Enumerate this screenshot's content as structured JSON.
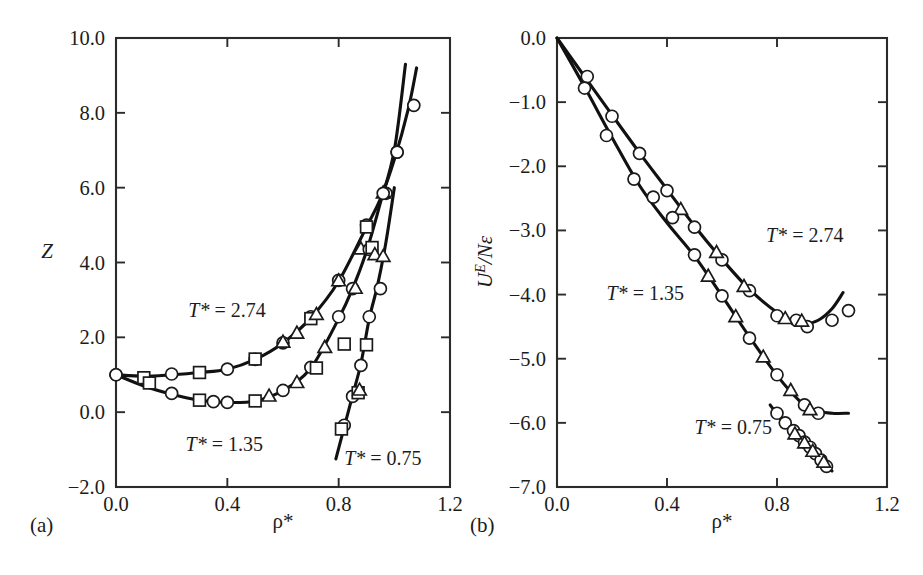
{
  "figure": {
    "background_color": "#ffffff",
    "ink_color": "#1a1a1a",
    "panels": [
      {
        "id": "a",
        "panel_label": "(a)",
        "xlabel": "ρ*",
        "ylabel": "Z"
      },
      {
        "id": "b",
        "panel_label": "(b)",
        "xlabel": "ρ*",
        "ylabel_rich": "Uᴱ/Nε",
        "ylabel_main": "U",
        "ylabel_sup": "E",
        "ylabel_rest": "/Nε"
      }
    ]
  },
  "chart_data": [
    {
      "type": "scatter",
      "panel": "a",
      "title": "",
      "xlabel": "ρ*",
      "ylabel": "Z",
      "xlim": [
        0.0,
        1.2
      ],
      "ylim": [
        -2.0,
        10.0
      ],
      "xticks": [
        0.0,
        0.4,
        0.8,
        1.2
      ],
      "xticklabels": [
        "0.0",
        "0.4",
        "0.8",
        "1.2"
      ],
      "yticks": [
        -2.0,
        0.0,
        2.0,
        4.0,
        6.0,
        8.0,
        10.0
      ],
      "yticklabels": [
        "-2.0",
        "0.0",
        "2.0",
        "4.0",
        "6.0",
        "8.0",
        "10.0"
      ],
      "grid": false,
      "legend": "inline-annotations",
      "annotations": [
        {
          "text_italic": "T*",
          "text_rest": " = 2.74",
          "x": 0.26,
          "y": 2.55
        },
        {
          "text_italic": "T*",
          "text_rest": " = 1.35",
          "x": 0.25,
          "y": -1.05
        },
        {
          "text_italic": "T*",
          "text_rest": " = 0.75",
          "x": 0.82,
          "y": -1.42
        }
      ],
      "series": [
        {
          "name": "T* = 2.74",
          "temperature": 2.74,
          "marker_sets": [
            {
              "marker": "circle",
              "points": [
                [
                  0.0,
                  1.0
                ],
                [
                  0.2,
                  1.02
                ],
                [
                  0.4,
                  1.15
                ],
                [
                  0.5,
                  1.41
                ],
                [
                  0.6,
                  1.85
                ],
                [
                  0.7,
                  2.55
                ],
                [
                  0.8,
                  3.52
                ],
                [
                  0.9,
                  5.0
                ],
                [
                  0.97,
                  5.85
                ],
                [
                  1.01,
                  6.95
                ],
                [
                  1.07,
                  8.2
                ]
              ]
            },
            {
              "marker": "square",
              "points": [
                [
                  0.1,
                  0.92
                ],
                [
                  0.3,
                  1.06
                ],
                [
                  0.5,
                  1.42
                ],
                [
                  0.7,
                  2.5
                ],
                [
                  0.9,
                  4.95
                ]
              ]
            },
            {
              "marker": "triangle",
              "points": [
                [
                  0.6,
                  1.86
                ],
                [
                  0.65,
                  2.1
                ],
                [
                  0.72,
                  2.6
                ],
                [
                  0.8,
                  3.5
                ],
                [
                  0.88,
                  4.35
                ],
                [
                  0.96,
                  5.85
                ]
              ]
            }
          ],
          "fit_curve": [
            [
              0.0,
              1.0
            ],
            [
              0.1,
              0.96
            ],
            [
              0.2,
              1.0
            ],
            [
              0.3,
              1.06
            ],
            [
              0.4,
              1.15
            ],
            [
              0.5,
              1.41
            ],
            [
              0.6,
              1.85
            ],
            [
              0.7,
              2.52
            ],
            [
              0.8,
              3.5
            ],
            [
              0.9,
              4.95
            ],
            [
              0.95,
              5.7
            ],
            [
              1.0,
              6.75
            ],
            [
              1.05,
              8.1
            ],
            [
              1.08,
              9.2
            ]
          ]
        },
        {
          "name": "T* = 1.35",
          "temperature": 1.35,
          "marker_sets": [
            {
              "marker": "circle",
              "points": [
                [
                  0.0,
                  1.0
                ],
                [
                  0.2,
                  0.5
                ],
                [
                  0.35,
                  0.28
                ],
                [
                  0.4,
                  0.26
                ],
                [
                  0.6,
                  0.58
                ],
                [
                  0.7,
                  1.2
                ],
                [
                  0.8,
                  2.55
                ],
                [
                  0.85,
                  3.3
                ],
                [
                  0.91,
                  4.35
                ],
                [
                  0.96,
                  5.85
                ],
                [
                  1.01,
                  6.95
                ]
              ]
            },
            {
              "marker": "square",
              "points": [
                [
                  0.12,
                  0.78
                ],
                [
                  0.3,
                  0.32
                ],
                [
                  0.5,
                  0.3
                ],
                [
                  0.72,
                  1.18
                ],
                [
                  0.82,
                  1.82
                ],
                [
                  0.92,
                  4.4
                ]
              ]
            },
            {
              "marker": "triangle",
              "points": [
                [
                  0.55,
                  0.42
                ],
                [
                  0.65,
                  0.78
                ],
                [
                  0.75,
                  1.72
                ],
                [
                  0.86,
                  3.3
                ],
                [
                  0.93,
                  4.2
                ]
              ]
            }
          ],
          "fit_curve": [
            [
              0.0,
              1.0
            ],
            [
              0.1,
              0.7
            ],
            [
              0.2,
              0.48
            ],
            [
              0.3,
              0.32
            ],
            [
              0.4,
              0.26
            ],
            [
              0.5,
              0.3
            ],
            [
              0.6,
              0.58
            ],
            [
              0.7,
              1.18
            ],
            [
              0.8,
              2.5
            ],
            [
              0.85,
              3.3
            ],
            [
              0.9,
              4.3
            ],
            [
              0.95,
              5.6
            ],
            [
              1.0,
              7.0
            ],
            [
              1.04,
              9.3
            ]
          ]
        },
        {
          "name": "T* = 0.75",
          "temperature": 0.75,
          "marker_sets": [
            {
              "marker": "circle",
              "points": [
                [
                  0.82,
                  -0.35
                ],
                [
                  0.85,
                  0.42
                ],
                [
                  0.88,
                  1.25
                ],
                [
                  0.91,
                  2.55
                ],
                [
                  0.95,
                  3.3
                ]
              ]
            },
            {
              "marker": "square",
              "points": [
                [
                  0.81,
                  -0.45
                ],
                [
                  0.87,
                  0.52
                ],
                [
                  0.9,
                  1.8
                ]
              ]
            },
            {
              "marker": "triangle",
              "points": [
                [
                  0.875,
                  0.58
                ],
                [
                  0.96,
                  4.15
                ]
              ]
            }
          ],
          "fit_curve": [
            [
              0.79,
              -1.25
            ],
            [
              0.82,
              -0.4
            ],
            [
              0.85,
              0.45
            ],
            [
              0.88,
              1.3
            ],
            [
              0.91,
              2.5
            ],
            [
              0.94,
              3.4
            ],
            [
              0.97,
              4.55
            ],
            [
              1.0,
              6.0
            ]
          ]
        }
      ]
    },
    {
      "type": "scatter",
      "panel": "b",
      "title": "",
      "xlabel": "ρ*",
      "ylabel": "U^E/Nε",
      "xlim": [
        0.0,
        1.2
      ],
      "ylim": [
        -7.0,
        0.0
      ],
      "xticks": [
        0.0,
        0.4,
        0.8,
        1.2
      ],
      "xticklabels": [
        "0.0",
        "0.4",
        "0.8",
        "1.2"
      ],
      "yticks": [
        -7.0,
        -6.0,
        -5.0,
        -4.0,
        -3.0,
        -2.0,
        -1.0,
        0.0
      ],
      "yticklabels": [
        "-7.0",
        "-6.0",
        "-5.0",
        "-4.0",
        "-3.0",
        "-2.0",
        "-1.0",
        "0.0"
      ],
      "grid": false,
      "legend": "inline-annotations",
      "annotations": [
        {
          "text_italic": "T*",
          "text_rest": " = 2.74",
          "x": 0.76,
          "y": -3.18
        },
        {
          "text_italic": "T*",
          "text_rest": " = 1.35",
          "x": 0.18,
          "y": -4.08
        },
        {
          "text_italic": "T*",
          "text_rest": " = 0.75",
          "x": 0.5,
          "y": -6.18
        }
      ],
      "series": [
        {
          "name": "T* = 2.74",
          "temperature": 2.74,
          "marker_sets": [
            {
              "marker": "circle",
              "points": [
                [
                  0.11,
                  -0.6
                ],
                [
                  0.2,
                  -1.22
                ],
                [
                  0.3,
                  -1.8
                ],
                [
                  0.4,
                  -2.38
                ],
                [
                  0.5,
                  -2.95
                ],
                [
                  0.6,
                  -3.46
                ],
                [
                  0.7,
                  -3.94
                ],
                [
                  0.8,
                  -4.33
                ],
                [
                  0.87,
                  -4.4
                ],
                [
                  0.91,
                  -4.5
                ],
                [
                  1.0,
                  -4.4
                ],
                [
                  1.06,
                  -4.25
                ]
              ]
            },
            {
              "marker": "triangle",
              "points": [
                [
                  0.45,
                  -2.68
                ],
                [
                  0.58,
                  -3.35
                ],
                [
                  0.68,
                  -3.88
                ],
                [
                  0.83,
                  -4.38
                ],
                [
                  0.89,
                  -4.42
                ]
              ]
            }
          ],
          "fit_curve": [
            [
              0.0,
              0.0
            ],
            [
              0.1,
              -0.6
            ],
            [
              0.2,
              -1.2
            ],
            [
              0.3,
              -1.79
            ],
            [
              0.4,
              -2.36
            ],
            [
              0.5,
              -2.93
            ],
            [
              0.6,
              -3.45
            ],
            [
              0.7,
              -3.92
            ],
            [
              0.8,
              -4.28
            ],
            [
              0.86,
              -4.42
            ],
            [
              0.9,
              -4.46
            ],
            [
              0.95,
              -4.4
            ],
            [
              1.0,
              -4.22
            ],
            [
              1.04,
              -3.97
            ]
          ]
        },
        {
          "name": "T* = 1.35",
          "temperature": 1.35,
          "marker_sets": [
            {
              "marker": "circle",
              "points": [
                [
                  0.1,
                  -0.78
                ],
                [
                  0.18,
                  -1.52
                ],
                [
                  0.28,
                  -2.2
                ],
                [
                  0.35,
                  -2.48
                ],
                [
                  0.42,
                  -2.8
                ],
                [
                  0.5,
                  -3.38
                ],
                [
                  0.6,
                  -4.02
                ],
                [
                  0.7,
                  -4.68
                ],
                [
                  0.8,
                  -5.25
                ],
                [
                  0.9,
                  -5.72
                ],
                [
                  0.95,
                  -5.85
                ]
              ]
            },
            {
              "marker": "triangle",
              "points": [
                [
                  0.55,
                  -3.72
                ],
                [
                  0.65,
                  -4.35
                ],
                [
                  0.75,
                  -4.98
                ],
                [
                  0.85,
                  -5.5
                ],
                [
                  0.92,
                  -5.8
                ]
              ]
            }
          ],
          "fit_curve": [
            [
              0.0,
              0.0
            ],
            [
              0.1,
              -0.76
            ],
            [
              0.2,
              -1.55
            ],
            [
              0.3,
              -2.3
            ],
            [
              0.4,
              -2.88
            ],
            [
              0.5,
              -3.4
            ],
            [
              0.6,
              -4.02
            ],
            [
              0.7,
              -4.66
            ],
            [
              0.8,
              -5.26
            ],
            [
              0.88,
              -5.65
            ],
            [
              0.93,
              -5.8
            ],
            [
              1.0,
              -5.85
            ],
            [
              1.06,
              -5.85
            ]
          ]
        },
        {
          "name": "T* = 0.75",
          "temperature": 0.75,
          "marker_sets": [
            {
              "marker": "circle",
              "points": [
                [
                  0.8,
                  -5.85
                ],
                [
                  0.83,
                  -6.0
                ],
                [
                  0.86,
                  -6.12
                ],
                [
                  0.88,
                  -6.2
                ],
                [
                  0.9,
                  -6.3
                ],
                [
                  0.92,
                  -6.38
                ],
                [
                  0.94,
                  -6.48
                ],
                [
                  0.96,
                  -6.58
                ],
                [
                  0.98,
                  -6.68
                ]
              ]
            },
            {
              "marker": "triangle",
              "points": [
                [
                  0.865,
                  -6.18
                ],
                [
                  0.9,
                  -6.32
                ],
                [
                  0.93,
                  -6.45
                ],
                [
                  0.97,
                  -6.62
                ]
              ]
            }
          ],
          "fit_curve": [
            [
              0.775,
              -5.72
            ],
            [
              0.82,
              -5.98
            ],
            [
              0.86,
              -6.15
            ],
            [
              0.9,
              -6.33
            ],
            [
              0.94,
              -6.5
            ],
            [
              0.98,
              -6.68
            ],
            [
              1.0,
              -6.75
            ]
          ]
        }
      ]
    }
  ]
}
